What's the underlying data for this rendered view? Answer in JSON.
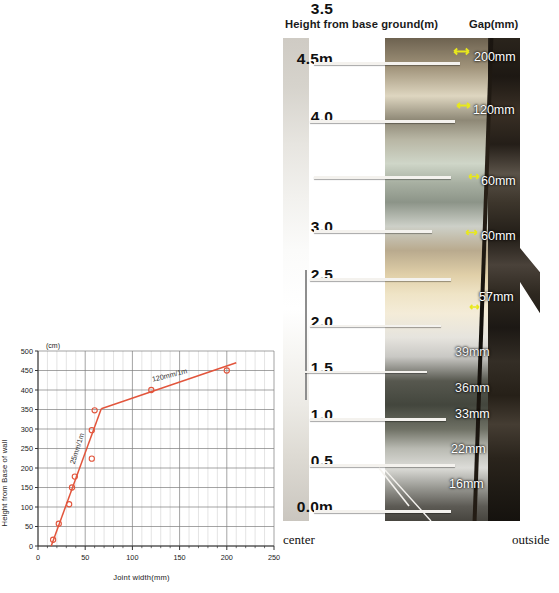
{
  "photo_panel": {
    "headers": {
      "height_header": "Height from base ground(m)",
      "gap_header": "Gap(mm)"
    },
    "height_ticks": [
      "4.5m",
      "4.0",
      "3.5",
      "3.0",
      "2.5",
      "2.0",
      "1.5",
      "1.0",
      "0.5",
      "0.0m"
    ],
    "gap_labels": [
      {
        "text": "200mm",
        "height_m": 4.5
      },
      {
        "text": "120mm",
        "height_m": 4.0
      },
      {
        "text": "60mm",
        "height_m": 3.5
      },
      {
        "text": "60mm",
        "height_m": 3.0
      },
      {
        "text": "57mm",
        "height_m": 2.2
      },
      {
        "text": "39mm",
        "height_m": 1.8
      },
      {
        "text": "36mm",
        "height_m": 1.45
      },
      {
        "text": "33mm",
        "height_m": 1.15
      },
      {
        "text": "22mm",
        "height_m": 0.55
      },
      {
        "text": "16mm",
        "height_m": 0.2
      }
    ],
    "direction_labels": {
      "left": "center",
      "right": "outside"
    }
  },
  "chart_data": {
    "type": "scatter",
    "title": "",
    "xlabel": "Joint width(mm)",
    "ylabel": "Height from Base of wall",
    "yunit": "(cm)",
    "xlim": [
      0,
      250
    ],
    "ylim": [
      0,
      500
    ],
    "xticks": [
      0,
      50,
      100,
      150,
      200,
      250
    ],
    "yticks": [
      0,
      50,
      100,
      150,
      200,
      250,
      300,
      350,
      400,
      450,
      500
    ],
    "grid": true,
    "legend": "none",
    "series": [
      {
        "name": "Joint width vs height",
        "x": [
          16,
          22,
          33,
          36,
          39,
          57,
          57,
          60,
          120,
          200
        ],
        "y": [
          16,
          57,
          107,
          150,
          178,
          224,
          297,
          348,
          400,
          450
        ]
      }
    ],
    "fit_lines": [
      {
        "label": "25mm/1m",
        "x": [
          14,
          67
        ],
        "y": [
          0,
          352
        ]
      },
      {
        "label": "120mm/1m",
        "x": [
          67,
          210
        ],
        "y": [
          352,
          470
        ]
      }
    ],
    "annotations": [
      {
        "text": "25mm/1m",
        "x": 44,
        "y": 248
      },
      {
        "text": "120mm/1m",
        "x": 140,
        "y": 432
      }
    ],
    "marker": "open-circle",
    "color": "#e2553c"
  }
}
